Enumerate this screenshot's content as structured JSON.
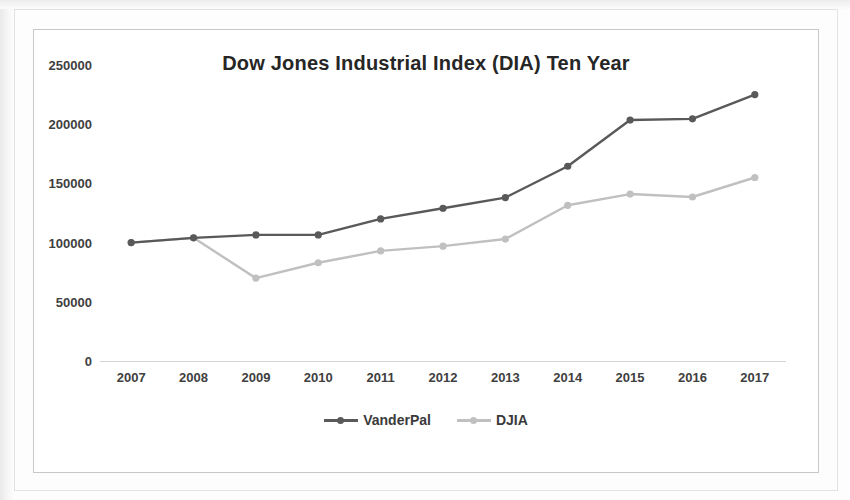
{
  "chart_data": {
    "type": "line",
    "title": "Dow Jones Industrial Index (DIA) Ten Year",
    "xlabel": "",
    "ylabel": "",
    "categories": [
      "2007",
      "2008",
      "2009",
      "2010",
      "2011",
      "2012",
      "2013",
      "2014",
      "2015",
      "2016",
      "2017"
    ],
    "series": [
      {
        "name": "VanderPal",
        "color": "#595959",
        "values": [
          100000,
          104000,
          106500,
          106500,
          120000,
          129000,
          138000,
          164500,
          203500,
          204500,
          225000
        ]
      },
      {
        "name": "DJIA",
        "color": "#c0c0c0",
        "values": [
          100000,
          104000,
          70000,
          83000,
          93000,
          97000,
          103000,
          131500,
          141000,
          138500,
          155000
        ]
      }
    ],
    "ylim": [
      0,
      250000
    ],
    "yticks": [
      0,
      50000,
      100000,
      150000,
      200000,
      250000
    ],
    "ytick_labels": [
      "0",
      "50000",
      "100000",
      "150000",
      "200000",
      "250000"
    ],
    "grid": false,
    "legend_position": "bottom"
  },
  "legend": {
    "entries": [
      {
        "label": "VanderPal",
        "color": "#595959"
      },
      {
        "label": "DJIA",
        "color": "#c0c0c0"
      }
    ]
  }
}
